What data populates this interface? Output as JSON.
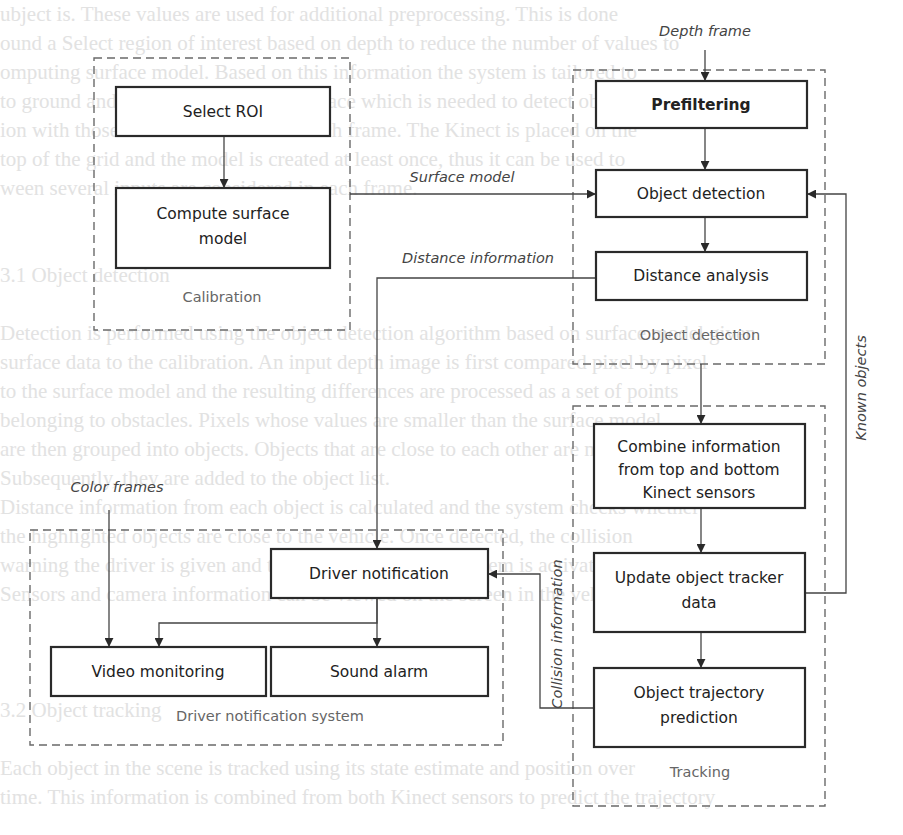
{
  "background_text_lines": [
    "ubject is. These values are used for additional preprocessing. This is done",
    "ound a Select region of interest based on depth to reduce the number of values to",
    "omputing surface model. Based on this information the system is tailored to",
    "to ground and is used to model the surface which is needed to detect objects from",
    "ion with those data is calculated for each frame. The Kinect is placed on the",
    "top of the grid and the model is created at least once, thus it can be used to",
    "ween several inputs are considered in each frame.",
    "",
    "",
    "3.1 Object detection",
    "",
    "Detection is performed using the object detection algorithm based on surface model given",
    "surface data to the calibration. An input depth image is first compared pixel by pixel",
    "to the surface model and the resulting differences are processed as a set of points",
    "belonging to obstacles. Pixels whose values are smaller than the surface model",
    "are then grouped into objects. Objects that are close to each other are merged.",
    "Subsequently, they are added to the object list.",
    "  Distance information from each object is calculated and the system checks whether",
    "the highlighted objects are close to the vehicle. Once detected, the collision",
    "warning the driver is given and the driver notification system is activated.",
    "Sensors and camera information can be viewed on the screen in the vehicle.",
    "",
    "",
    "",
    "3.2 Object tracking",
    "",
    "Each object in the scene is tracked using its state estimate and position over",
    "time. This information is combined from both Kinect sensors to predict the trajectory"
  ],
  "labels": {
    "depth_frame": "Depth frame",
    "surface_model": "Surface model",
    "distance_information": "Distance information",
    "known_objects": "Known objects",
    "color_frames": "Color frames",
    "collision_information": "Collision information"
  },
  "groups": {
    "calibration": "Calibration",
    "object_detection": "Object detection",
    "tracking": "Tracking",
    "driver_notification_system": "Driver notification system"
  },
  "boxes": {
    "select_roi": [
      "Select ROI"
    ],
    "compute_surface_model": [
      "Compute surface",
      "model"
    ],
    "prefiltering": [
      "Prefiltering"
    ],
    "object_detection": [
      "Object detection"
    ],
    "distance_analysis": [
      "Distance analysis"
    ],
    "combine_information": [
      "Combine information",
      "from top and bottom",
      "Kinect sensors"
    ],
    "update_tracker": [
      "Update object tracker",
      "data"
    ],
    "trajectory_prediction": [
      "Object trajectory",
      "prediction"
    ],
    "driver_notification": [
      "Driver notification"
    ],
    "video_monitoring": [
      "Video monitoring"
    ],
    "sound_alarm": [
      "Sound alarm"
    ]
  },
  "colors": {
    "box_stroke": "#2a2a2a",
    "dash_stroke": "#6a6a6a",
    "label_gray": "#666666",
    "background_text": "#e2e2e2"
  }
}
